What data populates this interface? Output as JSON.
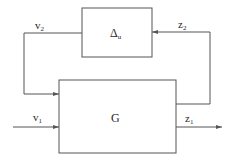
{
  "diagram": {
    "type": "block-diagram",
    "blocks": [
      {
        "id": "delta",
        "label": "Δ",
        "subscript": "u"
      },
      {
        "id": "G",
        "label": "G"
      }
    ],
    "signals": [
      {
        "id": "v2",
        "label": "v",
        "subscript": "2",
        "from": "delta",
        "to": "G"
      },
      {
        "id": "z2",
        "label": "z",
        "subscript": "2",
        "from": "G",
        "to": "delta"
      },
      {
        "id": "v1",
        "label": "v",
        "subscript": "1",
        "from": "input",
        "to": "G"
      },
      {
        "id": "z1",
        "label": "z",
        "subscript": "1",
        "from": "G",
        "to": "output"
      }
    ],
    "colors": {
      "line": "#555555",
      "text": "#2a2a2a",
      "background": "#ffffff"
    }
  }
}
